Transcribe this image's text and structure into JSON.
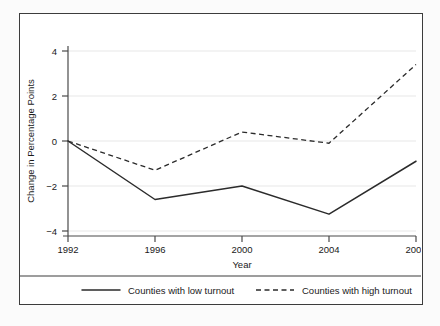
{
  "chart_data": {
    "type": "line",
    "title": "",
    "subtitle": "",
    "xlabel": "Year",
    "ylabel": "Change in Percentage Points",
    "x": [
      1992,
      1996,
      2000,
      2004,
      2008
    ],
    "xticklabels": [
      "1992",
      "1996",
      "2000",
      "2004",
      "2008"
    ],
    "yticks": [
      4,
      2,
      0,
      -2,
      -4
    ],
    "yticklabels": [
      "4",
      "2",
      "0",
      "−2",
      "−4"
    ],
    "xlim": [
      1992,
      2008
    ],
    "ylim": [
      -4,
      4
    ],
    "grid": "horizontal",
    "legend_position": "bottom",
    "series": [
      {
        "name": "Counties with low turnout",
        "style": "solid",
        "color": "#2b2b2b",
        "values": [
          0,
          -2.6,
          -2.0,
          -3.25,
          -0.9
        ]
      },
      {
        "name": "Counties with high turnout",
        "style": "dashed",
        "color": "#2b2b2b",
        "values": [
          0,
          -1.3,
          0.4,
          -0.1,
          3.4
        ]
      }
    ]
  },
  "legend": {
    "entries": [
      {
        "label": "Counties with low turnout",
        "style": "solid"
      },
      {
        "label": "Counties with high turnout",
        "style": "dashed"
      }
    ]
  },
  "axes": {
    "y_title": "Change in Percentage Points",
    "x_title": "Year",
    "y_tick_0": "4",
    "y_tick_1": "2",
    "y_tick_2": "0",
    "y_tick_3": "−2",
    "y_tick_4": "−4",
    "x_tick_0": "1992",
    "x_tick_1": "1996",
    "x_tick_2": "2000",
    "x_tick_3": "2004",
    "x_tick_4": "2008"
  },
  "colors": {
    "frame": "#3c3c3c",
    "grid": "#e8e8e8",
    "axis": "#4a4a4a",
    "line": "#2b2b2b",
    "background": "#ffffff",
    "page": "#fbfbfb"
  }
}
